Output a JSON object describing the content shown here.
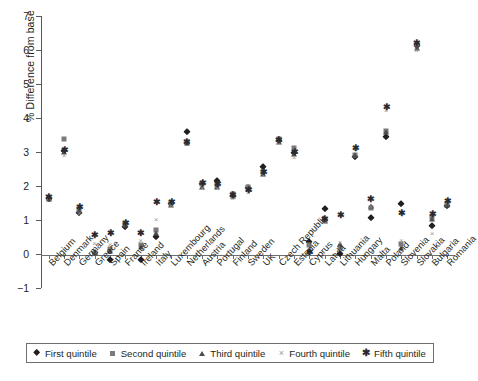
{
  "chart_data": {
    "type": "scatter",
    "title": "",
    "xlabel": "",
    "ylabel": "% Difference from base",
    "ylim": [
      -1,
      7
    ],
    "yticks": [
      -1,
      0,
      1,
      2,
      3,
      4,
      5,
      6,
      7
    ],
    "ytick_labels": [
      "−1",
      "0",
      "1",
      "2",
      "3",
      "4",
      "5",
      "6",
      "7"
    ],
    "grid": false,
    "legend_position": "bottom",
    "zero_reference_line": true,
    "categories": [
      "Belgium",
      "Denmark",
      "Germany",
      "Greece",
      "Spain",
      "France",
      "Ireland",
      "Italy",
      "Luxembourg",
      "Netherlands",
      "Austria",
      "Portugal",
      "Finland",
      "Sweden",
      "UK",
      "Czech Republic",
      "Estonia",
      "Cyprus",
      "Latvia",
      "Lithuania",
      "Hungary",
      "Malta",
      "Poland",
      "Slovenia",
      "Slovakia",
      "Bulgaria",
      "Romania"
    ],
    "series": [
      {
        "name": "First quintile",
        "marker": "diamond",
        "color": "#231f20",
        "values": [
          1.62,
          3.02,
          1.2,
          0.02,
          -0.17,
          0.8,
          -0.19,
          0.5,
          1.48,
          3.58,
          2.05,
          2.15,
          1.72,
          1.95,
          2.57,
          3.33,
          2.96,
          0.34,
          1.32,
          0.0,
          2.85,
          1.05,
          3.43,
          1.47,
          6.12,
          0.83,
          1.42
        ]
      },
      {
        "name": "Second quintile",
        "marker": "square",
        "color": "#7b7b7d",
        "values": [
          1.66,
          3.38,
          1.33,
          0.04,
          0.14,
          0.88,
          0.27,
          0.7,
          1.5,
          3.28,
          2.05,
          2.02,
          1.76,
          1.97,
          2.4,
          3.38,
          3.12,
          0.26,
          1.0,
          0.18,
          2.9,
          1.35,
          3.62,
          0.3,
          6.18,
          1.1,
          1.48
        ]
      },
      {
        "name": "Third quintile",
        "marker": "triangle",
        "color": "#4d4d4f",
        "values": [
          1.63,
          3.0,
          1.26,
          0.03,
          0.1,
          0.84,
          0.22,
          0.62,
          1.45,
          3.26,
          1.98,
          1.98,
          1.7,
          1.9,
          2.35,
          3.3,
          2.93,
          0.1,
          0.98,
          0.3,
          2.92,
          1.4,
          3.6,
          0.18,
          6.05,
          1.02,
          1.44
        ]
      },
      {
        "name": "Fourth quintile",
        "marker": "x",
        "color": "#9a9a9c",
        "values": [
          1.64,
          2.9,
          1.22,
          0.32,
          0.28,
          0.9,
          0.4,
          1.02,
          1.44,
          3.25,
          1.94,
          1.95,
          1.66,
          1.82,
          2.33,
          3.28,
          2.86,
          0.08,
          0.96,
          0.34,
          3.08,
          1.42,
          4.25,
          0.4,
          6.0,
          0.62,
          1.52
        ]
      },
      {
        "name": "Fifth quintile",
        "marker": "star",
        "color": "#2b2b2d",
        "values": [
          1.68,
          3.05,
          1.38,
          0.55,
          0.62,
          0.92,
          0.62,
          1.53,
          1.52,
          3.3,
          2.08,
          2.06,
          1.74,
          1.88,
          2.42,
          3.36,
          3.0,
          0.06,
          1.02,
          1.15,
          3.12,
          1.62,
          4.32,
          1.22,
          6.2,
          1.18,
          1.55
        ]
      }
    ]
  },
  "legend": {
    "items": [
      {
        "label": "First quintile",
        "glyph": "diamond-marker-icon"
      },
      {
        "label": "Second quintile",
        "glyph": "square-marker-icon"
      },
      {
        "label": "Third quintile",
        "glyph": "triangle-marker-icon"
      },
      {
        "label": "Fourth quintile",
        "glyph": "x-marker-icon"
      },
      {
        "label": "Fifth quintile",
        "glyph": "star-marker-icon"
      }
    ]
  }
}
